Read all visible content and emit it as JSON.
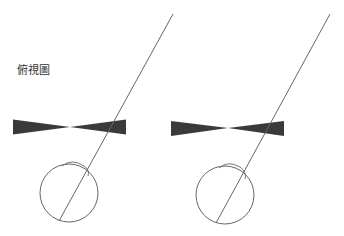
{
  "title": "俯視圖",
  "colors": {
    "background": "#ffffff",
    "shape_fill": "#3a3a3a",
    "line": "#666666"
  },
  "panels": [
    {
      "name": "left",
      "bowtie": {
        "x1": 13,
        "x2": 126,
        "cx": 70,
        "cy": 127,
        "half_height": 7.5
      },
      "eye": {
        "cx": 69,
        "cy": 193,
        "r": 29
      },
      "sight_line": {
        "x1": 173,
        "y1": 14,
        "x2": 59,
        "y2": 221
      }
    },
    {
      "name": "right",
      "bowtie": {
        "x1": 171,
        "x2": 284,
        "cx": 228,
        "cy": 128,
        "half_height": 7.5
      },
      "eye": {
        "cx": 225,
        "cy": 195,
        "r": 29
      },
      "sight_line": {
        "x1": 330,
        "y1": 14,
        "x2": 216,
        "y2": 223
      }
    }
  ]
}
